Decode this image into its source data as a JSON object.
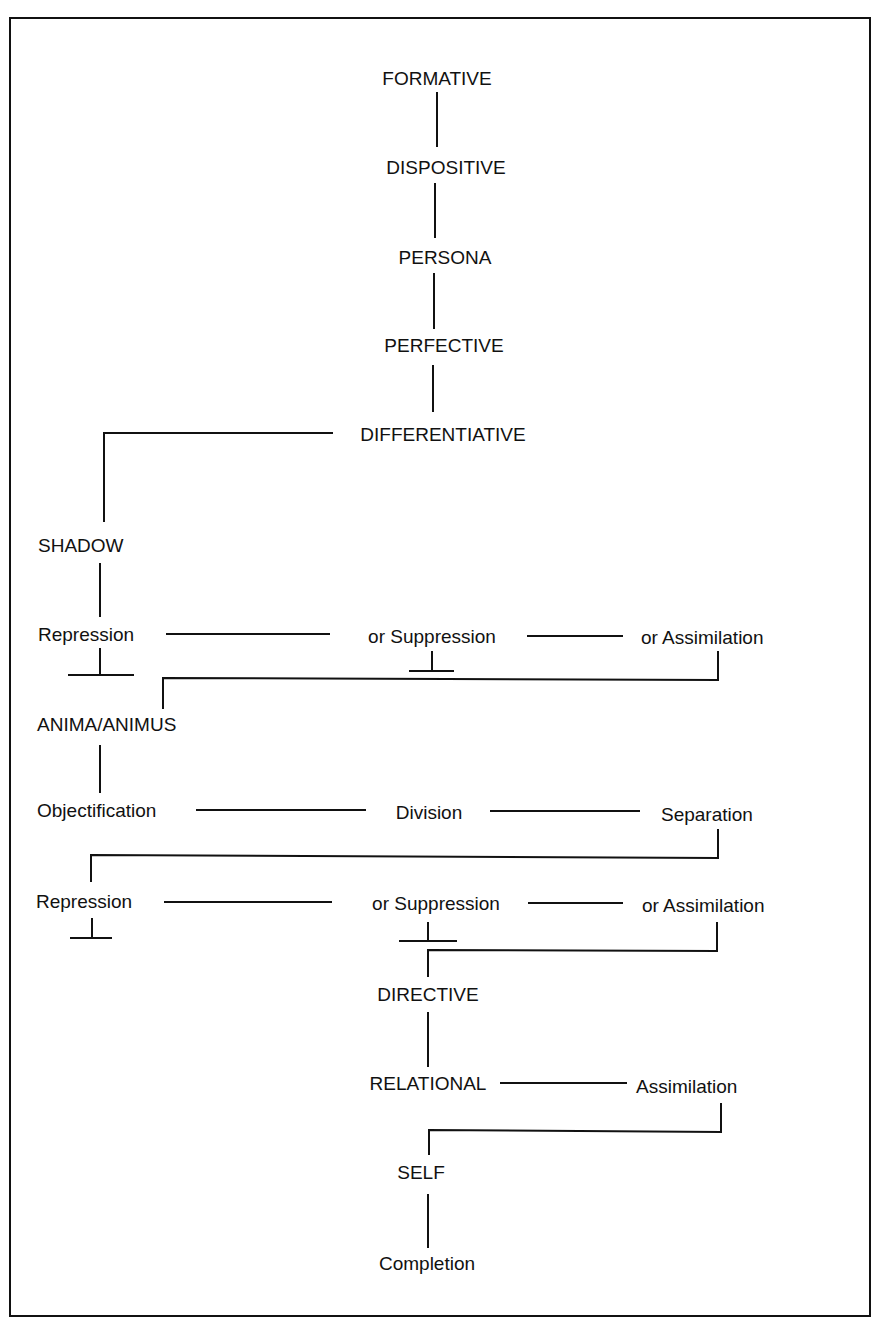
{
  "diagram": {
    "nodes": {
      "formative": "FORMATIVE",
      "dispositive": "DISPOSITIVE",
      "persona": "PERSONA",
      "perfective": "PERFECTIVE",
      "differentiative": "DIFFERENTIATIVE",
      "shadow": "SHADOW",
      "repression1": "Repression",
      "suppression1": "or Suppression",
      "assimilation1": "or Assimilation",
      "anima_animus": "ANIMA/ANIMUS",
      "objectification": "Objectification",
      "division": "Division",
      "separation": "Separation",
      "repression2": "Repression",
      "suppression2": "or Suppression",
      "assimilation2": "or Assimilation",
      "directive": "DIRECTIVE",
      "relational": "RELATIONAL",
      "assimilation3": "Assimilation",
      "self": "SELF",
      "completion": "Completion"
    }
  }
}
